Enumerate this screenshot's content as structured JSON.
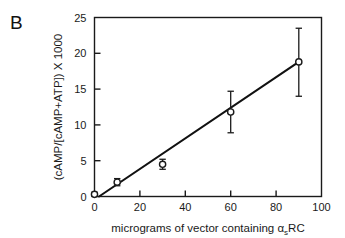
{
  "figure": {
    "panel_label": "B",
    "background_color": "#ffffff",
    "ink_color": "#1a1a1a"
  },
  "chart_data": {
    "type": "scatter",
    "title": "",
    "subtitle": "",
    "xlabel_parts": {
      "before": "micrograms of vector containing ",
      "alpha": "α",
      "subscript": "s",
      "after": "RC"
    },
    "xlabel": "micrograms of vector containing αsRC",
    "ylabel": "(cAMP/[cAMP+ATP]) X 1000",
    "xlim": [
      0,
      100
    ],
    "ylim": [
      0,
      25
    ],
    "xticks": [
      0,
      20,
      40,
      60,
      80,
      100
    ],
    "yticks": [
      0,
      5,
      10,
      15,
      20,
      25
    ],
    "xtick_labels": [
      "0",
      "20",
      "40",
      "60",
      "80",
      "100"
    ],
    "ytick_labels": [
      "0",
      "5",
      "10",
      "15",
      "20",
      "25"
    ],
    "grid": false,
    "legend": "none",
    "marker": "open-circle",
    "x": [
      0,
      10,
      30,
      60,
      90
    ],
    "values": [
      0.3,
      2.0,
      4.5,
      11.8,
      18.8
    ],
    "error_low": [
      0.3,
      0.5,
      0.7,
      2.9,
      4.8
    ],
    "error_high": [
      0.3,
      0.5,
      0.7,
      2.9,
      4.7
    ],
    "series": [
      {
        "name": "cAMP accumulation",
        "x": [
          0,
          10,
          30,
          60,
          90
        ],
        "values": [
          0.3,
          2.0,
          4.5,
          11.8,
          18.8
        ],
        "error_low": [
          0.3,
          0.5,
          0.7,
          2.9,
          4.8
        ],
        "error_high": [
          0.3,
          0.5,
          0.7,
          2.9,
          4.7
        ]
      }
    ],
    "fit_line": {
      "type": "linear",
      "x_start": 2.0,
      "y_start": 0.0,
      "x_end": 90.0,
      "y_end": 18.8
    },
    "axis_color": "#1a1a1a",
    "marker_color": "#1a1a1a",
    "line_color": "#111111"
  }
}
